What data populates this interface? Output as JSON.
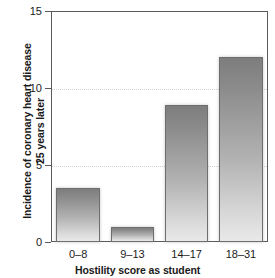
{
  "chart_data": {
    "type": "bar",
    "title": "",
    "categories": [
      "0–8",
      "9–13",
      "14–17",
      "18–31"
    ],
    "values": [
      3.5,
      1.0,
      8.9,
      12.0
    ],
    "xlabel": "Hostility score as student",
    "ylabel": "Incidence of coronary heart disease 25 years later",
    "ylabel_lines": [
      "Incidence of coronary heart disease",
      "25 years later"
    ],
    "ylim": [
      0,
      15
    ],
    "yticks": [
      0,
      5,
      10,
      15
    ],
    "ytick_labels": [
      "0",
      "5",
      "10",
      "15"
    ],
    "grid": true,
    "gridlines_at": [
      5,
      10
    ],
    "legend": null,
    "bar_color_top": "#7d7d7d",
    "bar_color_bottom": "#e9e9e9",
    "bar_border_color": "#6e6e6e",
    "axis_color": "#5a5a5a",
    "grid_color": "#cfcfcf",
    "background": "#ffffff"
  }
}
